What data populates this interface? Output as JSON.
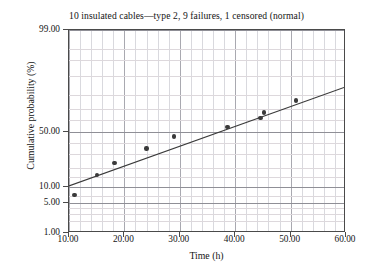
{
  "chart_data": {
    "type": "scatter",
    "title": "10 insulated cables—type 2, 9 failures, 1 censored (normal)",
    "xlabel": "Time (h)",
    "ylabel": "Cumulative probability (%)",
    "xlim": [
      10,
      60
    ],
    "ylim": [
      1,
      99
    ],
    "grid": true,
    "legend": "none",
    "yscale": "normal probability",
    "xticklabels": [
      "10.00",
      "20.00",
      "30.00",
      "40.00",
      "50.00",
      "60.00"
    ],
    "xtickvalues": [
      10,
      20,
      30,
      40,
      50,
      60
    ],
    "yticklabels": [
      "99.00",
      "50.00",
      "10.00",
      "5.00",
      "1.00"
    ],
    "ytickvalues": [
      99,
      50,
      10,
      5,
      1
    ],
    "points": [
      {
        "x": 11.0,
        "y": 7.3
      },
      {
        "x": 15.0,
        "y": 16.0
      },
      {
        "x": 18.2,
        "y": 23.5
      },
      {
        "x": 24.0,
        "y": 35.0
      },
      {
        "x": 29.0,
        "y": 45.5
      },
      {
        "x": 38.6,
        "y": 54.0
      },
      {
        "x": 44.6,
        "y": 62.0
      },
      {
        "x": 45.2,
        "y": 67.0
      },
      {
        "x": 51.0,
        "y": 76.0
      }
    ],
    "fit_line": {
      "name": "normal fit",
      "x_start": 10.0,
      "y_start": 10.0,
      "x_end": 60.0,
      "y_end": 84.0
    }
  },
  "axes": {
    "x_title": "Time (h)",
    "y_title": "Cumulative probability (%)"
  }
}
